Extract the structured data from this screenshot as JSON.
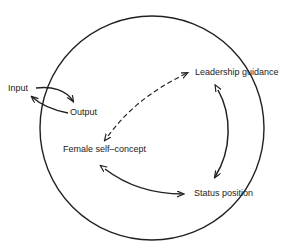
{
  "diagram": {
    "nodes": {
      "input": "Input",
      "output": "Output",
      "leadership": "Leadership guidance",
      "self_concept": "Female self–concept",
      "status": "Status position"
    },
    "edges": [
      {
        "from": "Input",
        "to": "Output",
        "style": "solid",
        "direction": "forward"
      },
      {
        "from": "Output",
        "to": "Input",
        "style": "solid",
        "direction": "forward"
      },
      {
        "from": "Female self–concept",
        "to": "Leadership guidance",
        "style": "dashed",
        "direction": "bidirectional"
      },
      {
        "from": "Leadership guidance",
        "to": "Status position",
        "style": "solid",
        "direction": "bidirectional"
      },
      {
        "from": "Female self–concept",
        "to": "Status position",
        "style": "solid",
        "direction": "bidirectional"
      }
    ],
    "boundary": "circle",
    "colors": {
      "line": "#222222",
      "background": "#ffffff"
    }
  }
}
